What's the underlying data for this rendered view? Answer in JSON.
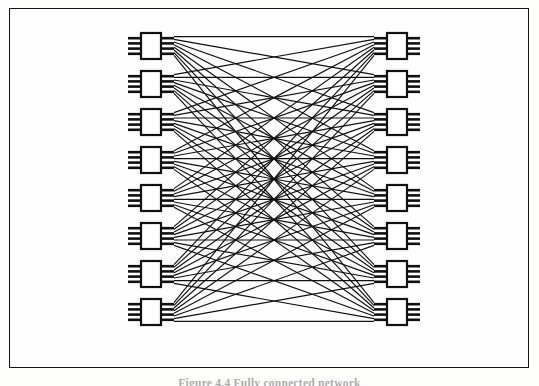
{
  "page": {
    "background_color": "#fdfdfc",
    "width": 539,
    "height": 386
  },
  "figure": {
    "frame": {
      "x": 9,
      "y": 8,
      "width": 520,
      "height": 360,
      "border_color": "#151515",
      "border_width": 1.6,
      "fill_color": "#fefefe"
    },
    "caption": {
      "text": "Figure 4.4  Fully connected network",
      "visible": "cropped",
      "note": "Caption is clipped by the bottom edge of the scan; only the tops of the glyphs are visible."
    }
  },
  "chart_data": {
    "type": "diagram",
    "subtype": "complete-bipartite-interconnection-network",
    "title": "Fully connected network",
    "left_column": {
      "label": "left module column",
      "count": 8,
      "module_count": 8,
      "x_center": 151,
      "module_width": 20,
      "module_height": 26,
      "first_module_y_center": 46,
      "pitch": 38,
      "pins_per_side": 4
    },
    "right_column": {
      "label": "right module column",
      "count": 8,
      "module_count": 8,
      "x_center": 397,
      "module_width": 20,
      "module_height": 26,
      "first_module_y_center": 46,
      "pitch": 38,
      "pins_per_side": 4
    },
    "links": {
      "label": "interconnection links",
      "total": 64,
      "topology": "every-to-every",
      "line_color": "#101010",
      "line_width": 1.15
    },
    "module_style": {
      "body_fill": "#ffffff",
      "body_stroke": "#101010",
      "body_stroke_width": 2.2,
      "pin_color": "#101010",
      "pin_length": 13,
      "pin_thickness": 2.6
    },
    "ink_color": "#101010",
    "paper_color": "#fefefe"
  }
}
